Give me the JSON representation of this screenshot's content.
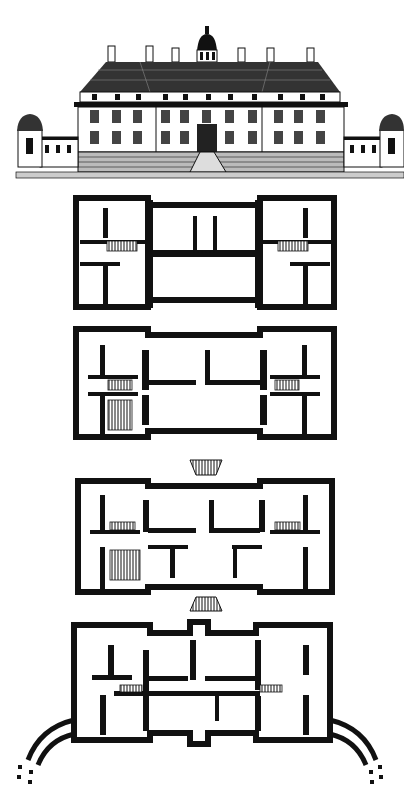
{
  "figure": {
    "type": "architectural-plate",
    "panels": [
      {
        "id": "elevation",
        "kind": "front elevation"
      },
      {
        "id": "plan-1",
        "kind": "floor plan",
        "order": 1
      },
      {
        "id": "plan-2",
        "kind": "floor plan",
        "order": 2
      },
      {
        "id": "plan-3",
        "kind": "floor plan",
        "order": 3,
        "features": [
          "front portico stair",
          "rear stair"
        ]
      },
      {
        "id": "plan-4",
        "kind": "ground/basement plan",
        "order": 4,
        "features": [
          "curved colonnade wings"
        ]
      }
    ],
    "colors": {
      "ink": "#111111",
      "paper": "#ffffff"
    }
  }
}
